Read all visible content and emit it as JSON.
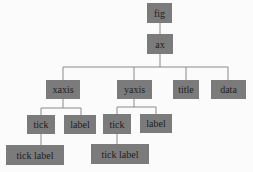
{
  "diagram": {
    "type": "tree",
    "colors": {
      "node_fill": "#7b7b7b",
      "edge": "#8a8a8a",
      "background": "#fbfbfb",
      "text": "#1e1e1e"
    },
    "nodes": {
      "fig": "fig",
      "ax": "ax",
      "xaxis": "xaxis",
      "yaxis": "yaxis",
      "title": "title",
      "data": "data",
      "xaxis_tick": "tick",
      "xaxis_label": "label",
      "xaxis_tick_label": "tick label",
      "yaxis_tick": "tick",
      "yaxis_label": "label",
      "yaxis_tick_label": "tick label"
    },
    "edges": [
      [
        "fig",
        "ax"
      ],
      [
        "ax",
        "xaxis"
      ],
      [
        "ax",
        "yaxis"
      ],
      [
        "ax",
        "title"
      ],
      [
        "ax",
        "data"
      ],
      [
        "xaxis",
        "xaxis_tick"
      ],
      [
        "xaxis",
        "xaxis_label"
      ],
      [
        "xaxis_tick",
        "xaxis_tick_label"
      ],
      [
        "yaxis",
        "yaxis_tick"
      ],
      [
        "yaxis",
        "yaxis_label"
      ],
      [
        "yaxis_tick",
        "yaxis_tick_label"
      ]
    ]
  }
}
